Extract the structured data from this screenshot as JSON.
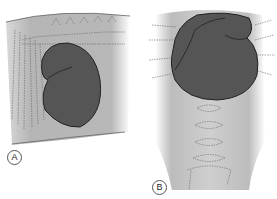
{
  "figure": {
    "panels": [
      {
        "id": "A",
        "label": "A",
        "view": "lateral"
      },
      {
        "id": "B",
        "label": "B",
        "view": "ventrodorsal"
      }
    ]
  },
  "colors": {
    "background_tissue": "#b8b8b8",
    "organ_fill": "#555555",
    "organ_outline": "#222222",
    "bone_dashes": "#666666",
    "label_border": "#555555"
  }
}
